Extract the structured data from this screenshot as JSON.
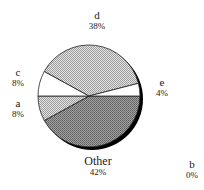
{
  "chart_data": {
    "type": "pie",
    "title": "",
    "categories": [
      "Other",
      "a",
      "c",
      "d",
      "e",
      "b"
    ],
    "values": [
      42,
      8,
      8,
      38,
      4,
      0
    ],
    "labels": [
      "Other 42%",
      "a 8%",
      "c 8%",
      "d 38%",
      "e 4%",
      "b 0%"
    ],
    "start_angle_deg": 0,
    "direction": "clockwise",
    "style": "3D-shadow pie with halftone fills",
    "legend": "none (labels placed next to slices)"
  },
  "slices": [
    {
      "name": "Other",
      "pct": "42%",
      "fill": "#8a8a8a"
    },
    {
      "name": "a",
      "pct": "8%",
      "fill": "#c4c4c4"
    },
    {
      "name": "c",
      "pct": "8%",
      "fill": "#ffffff"
    },
    {
      "name": "d",
      "pct": "38%",
      "fill": "#bdbdbd"
    },
    {
      "name": "e",
      "pct": "4%",
      "fill": "#ffffff"
    },
    {
      "name": "b",
      "pct": "0%",
      "fill": "#ffffff"
    }
  ],
  "colors": {
    "outline": "#222222",
    "shadow": "#000000"
  }
}
